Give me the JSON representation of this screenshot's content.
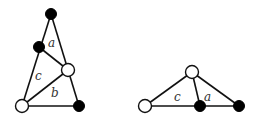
{
  "figures": [
    {
      "id": "left",
      "nodes": [
        {
          "id": "top",
          "x": 51,
          "y": 14,
          "color": "black"
        },
        {
          "id": "mid-left",
          "x": 39,
          "y": 47,
          "color": "black"
        },
        {
          "id": "mid-right",
          "x": 68,
          "y": 70,
          "color": "white"
        },
        {
          "id": "bottom-left",
          "x": 22,
          "y": 106,
          "color": "white"
        },
        {
          "id": "bottom-right",
          "x": 79,
          "y": 106,
          "color": "black"
        }
      ],
      "labels": [
        {
          "text": "a",
          "x": 48,
          "y": 47
        },
        {
          "text": "c",
          "x": 35,
          "y": 80
        },
        {
          "text": "b",
          "x": 51,
          "y": 97
        }
      ]
    },
    {
      "id": "right",
      "nodes": [
        {
          "id": "top",
          "x": 192,
          "y": 72,
          "color": "white"
        },
        {
          "id": "left",
          "x": 145,
          "y": 106,
          "color": "white"
        },
        {
          "id": "mid",
          "x": 200,
          "y": 106,
          "color": "black"
        },
        {
          "id": "right",
          "x": 239,
          "y": 106,
          "color": "black"
        }
      ],
      "labels": [
        {
          "text": "c",
          "x": 174,
          "y": 101
        },
        {
          "text": "a",
          "x": 204,
          "y": 101
        }
      ]
    }
  ]
}
